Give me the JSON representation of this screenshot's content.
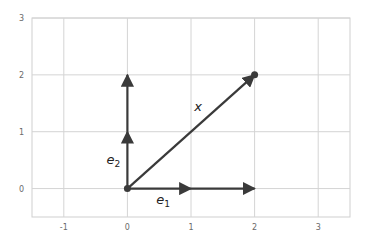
{
  "chart_data": {
    "type": "line",
    "title": "",
    "xlabel": "",
    "ylabel": "",
    "xlim": [
      -1.5,
      3.5
    ],
    "ylim": [
      -0.5,
      3
    ],
    "grid": true,
    "xticks": [
      "-1",
      "0",
      "1",
      "2",
      "3"
    ],
    "yticks": [
      "0",
      "1",
      "2",
      "3"
    ],
    "vectors": [
      {
        "name": "e1",
        "label": "e",
        "subscript": "1",
        "from": [
          0,
          0
        ],
        "to": [
          1,
          0
        ]
      },
      {
        "name": "2e1",
        "label": "",
        "from": [
          1,
          0
        ],
        "to": [
          2,
          0
        ]
      },
      {
        "name": "e2",
        "label": "e",
        "subscript": "2",
        "from": [
          0,
          0
        ],
        "to": [
          0,
          1
        ]
      },
      {
        "name": "2e2",
        "label": "",
        "from": [
          0,
          1
        ],
        "to": [
          0,
          2
        ]
      },
      {
        "name": "x",
        "label": "x",
        "from": [
          0,
          0
        ],
        "to": [
          2,
          2
        ]
      }
    ],
    "points": [
      {
        "name": "origin",
        "x": 0,
        "y": 0
      },
      {
        "name": "x-tip",
        "x": 2,
        "y": 2
      }
    ],
    "colors": {
      "vector": "#3a3a3a",
      "grid": "#d4d4d4",
      "axis_frame": "#cfcfcf",
      "tick_text": "#6a6a6a"
    }
  }
}
